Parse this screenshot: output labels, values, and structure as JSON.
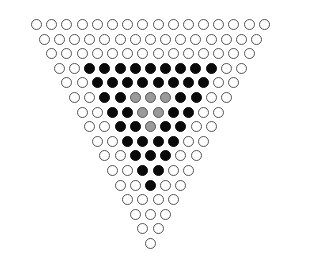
{
  "figure": {
    "width": 293,
    "height": 271,
    "background_color": "#ffffff",
    "geometry": {
      "rows": 16,
      "cell_diameter_px": 11,
      "horizontal_pitch_px": 15.2,
      "vertical_pitch_px": 14.6,
      "row1_left_px": 31,
      "row1_top_px": 19,
      "row_indent_px": 7.6
    },
    "legend": {
      "empty": {
        "label": "empty site",
        "color": "#ffffff",
        "stroke": "#555555"
      },
      "filled": {
        "label": "occupied site",
        "color": "#0a0a0a",
        "stroke": "#0a0a0a"
      },
      "half": {
        "label": "partially occupied site",
        "color": "#9a9a9a",
        "stroke": "#555555"
      }
    },
    "counts": {
      "total": 136,
      "empty": 83,
      "filled": 47,
      "half": 6
    }
  },
  "chart_data": {
    "type": "heatmap",
    "xlabel": "",
    "ylabel": "",
    "grid": false,
    "legend_position": "none",
    "categories": [
      "empty",
      "filled",
      "half"
    ],
    "values": [
      83,
      47,
      6
    ],
    "row_lengths": [
      16,
      15,
      14,
      13,
      12,
      11,
      10,
      9,
      8,
      7,
      6,
      5,
      4,
      3,
      2,
      1
    ],
    "rows": [
      {
        "index": 1,
        "count": 16,
        "states": [
          "empty",
          "empty",
          "empty",
          "empty",
          "empty",
          "empty",
          "empty",
          "empty",
          "empty",
          "empty",
          "empty",
          "empty",
          "empty",
          "empty",
          "empty",
          "empty"
        ]
      },
      {
        "index": 2,
        "count": 15,
        "states": [
          "empty",
          "empty",
          "empty",
          "empty",
          "empty",
          "empty",
          "empty",
          "empty",
          "empty",
          "empty",
          "empty",
          "empty",
          "empty",
          "empty",
          "empty"
        ]
      },
      {
        "index": 3,
        "count": 14,
        "states": [
          "empty",
          "empty",
          "empty",
          "empty",
          "empty",
          "empty",
          "empty",
          "empty",
          "empty",
          "empty",
          "empty",
          "empty",
          "empty",
          "empty"
        ]
      },
      {
        "index": 4,
        "count": 13,
        "states": [
          "empty",
          "empty",
          "filled",
          "filled",
          "filled",
          "filled",
          "filled",
          "filled",
          "filled",
          "filled",
          "filled",
          "empty",
          "empty"
        ]
      },
      {
        "index": 5,
        "count": 12,
        "states": [
          "empty",
          "empty",
          "filled",
          "filled",
          "filled",
          "filled",
          "filled",
          "filled",
          "filled",
          "filled",
          "empty",
          "empty"
        ]
      },
      {
        "index": 6,
        "count": 11,
        "states": [
          "empty",
          "empty",
          "filled",
          "filled",
          "half",
          "half",
          "half",
          "filled",
          "filled",
          "empty",
          "empty"
        ]
      },
      {
        "index": 7,
        "count": 10,
        "states": [
          "empty",
          "empty",
          "filled",
          "filled",
          "half",
          "half",
          "filled",
          "filled",
          "empty",
          "empty"
        ]
      },
      {
        "index": 8,
        "count": 9,
        "states": [
          "empty",
          "empty",
          "filled",
          "filled",
          "half",
          "filled",
          "filled",
          "empty",
          "empty"
        ]
      },
      {
        "index": 9,
        "count": 8,
        "states": [
          "empty",
          "empty",
          "filled",
          "filled",
          "filled",
          "filled",
          "empty",
          "empty"
        ]
      },
      {
        "index": 10,
        "count": 7,
        "states": [
          "empty",
          "empty",
          "filled",
          "filled",
          "filled",
          "empty",
          "empty"
        ]
      },
      {
        "index": 11,
        "count": 6,
        "states": [
          "empty",
          "empty",
          "filled",
          "filled",
          "empty",
          "empty"
        ]
      },
      {
        "index": 12,
        "count": 5,
        "states": [
          "empty",
          "empty",
          "filled",
          "empty",
          "empty"
        ]
      },
      {
        "index": 13,
        "count": 4,
        "states": [
          "empty",
          "empty",
          "empty",
          "empty"
        ]
      },
      {
        "index": 14,
        "count": 3,
        "states": [
          "empty",
          "empty",
          "empty"
        ]
      },
      {
        "index": 15,
        "count": 2,
        "states": [
          "empty",
          "empty"
        ]
      },
      {
        "index": 16,
        "count": 1,
        "states": [
          "empty"
        ]
      }
    ]
  }
}
